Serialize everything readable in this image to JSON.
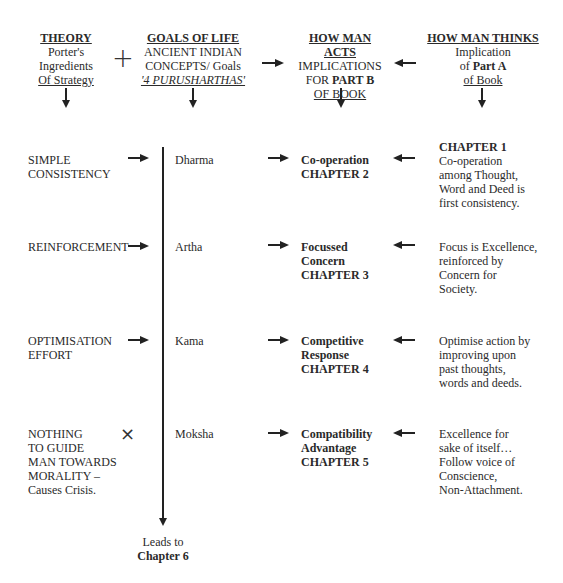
{
  "header": {
    "theory": {
      "title": "THEORY",
      "line1": "Porter's",
      "line2": "Ingredients",
      "line3": "Of Strategy"
    },
    "plus_symbol": "+",
    "goals": {
      "title": "GOALS OF LIFE",
      "line1": "ANCIENT INDIAN",
      "line2": "CONCEPTS/ Goals",
      "line3": "'4 PURUSHARTHAS'"
    },
    "acts": {
      "title": "HOW MAN ACTS",
      "line1": "IMPLICATIONS",
      "line2_prefix": "FOR ",
      "line2_bold": "PART B",
      "line3": "OF BOOK"
    },
    "thinks": {
      "title": "HOW MAN THINKS",
      "line1": "Implication",
      "line2_prefix": "of ",
      "line2_bold": "Part A",
      "line3": "of Book"
    }
  },
  "rows": [
    {
      "strategy": [
        "SIMPLE",
        "CONSISTENCY"
      ],
      "strategy_marker": "arrow",
      "goal": "Dharma",
      "action": [
        "Co-operation",
        "CHAPTER 2"
      ],
      "thought_title": "CHAPTER 1",
      "thought": [
        "Co-operation",
        "among Thought,",
        "Word and Deed is",
        "first consistency."
      ]
    },
    {
      "strategy": [
        "REINFORCEMENT"
      ],
      "strategy_marker": "arrow",
      "goal": "Artha",
      "action": [
        "Focussed",
        "Concern",
        "CHAPTER 3"
      ],
      "thought": [
        "Focus is Excellence,",
        "reinforced by",
        "Concern for",
        "Society."
      ]
    },
    {
      "strategy": [
        "OPTIMISATION",
        "EFFORT"
      ],
      "strategy_marker": "arrow",
      "goal": "Kama",
      "action": [
        "Competitive",
        "Response",
        "CHAPTER 4"
      ],
      "thought": [
        "Optimise action by",
        "improving upon",
        "past thoughts,",
        "words and deeds."
      ]
    },
    {
      "strategy": [
        "NOTHING",
        "TO GUIDE",
        "MAN TOWARDS",
        "MORALITY –",
        "Causes Crisis."
      ],
      "strategy_marker": "cross",
      "cross_symbol": "×",
      "goal": "Moksha",
      "action": [
        "Compatibility",
        "Advantage",
        "CHAPTER 5"
      ],
      "thought": [
        "Excellence for",
        "sake of itself…",
        "Follow voice of",
        "Conscience,",
        "Non-Attachment."
      ]
    }
  ],
  "footer": {
    "line1": "Leads to",
    "line2": "Chapter 6"
  }
}
